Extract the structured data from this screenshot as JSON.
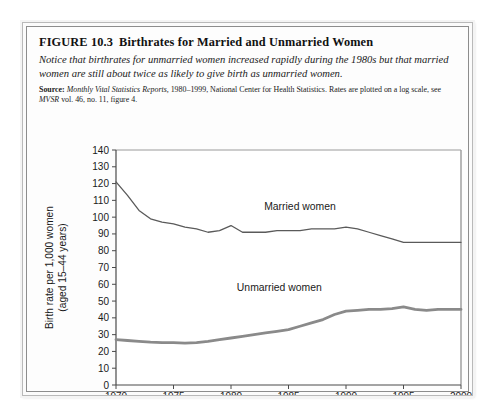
{
  "figure": {
    "number": "FIGURE 10.3",
    "title": "Birthrates for Married and Unmarried Women",
    "note": "Notice that birthrates for unmarried women increased rapidly during the 1980s but that married women are still about twice as likely to give birth as unmarried women.",
    "source_label": "Source:",
    "source_italic_1": "Monthly Vital Statistics Reports,",
    "source_rest_1": " 1980–1999, National Center for Health Statistics. Rates are plotted on a log scale, see ",
    "source_italic_2": "MVSR",
    "source_rest_2": " vol. 46, no. 11, figure 4."
  },
  "chart_data": {
    "type": "line",
    "title": "Birthrates for Married and Unmarried Women",
    "xlabel": "",
    "ylabel": "Birth rate per 1,000 women (aged 15–44 years)",
    "ylabel_line1": "Birth rate per 1,000 women",
    "ylabel_line2": "(aged 15–44 years)",
    "xlim": [
      1970,
      2000
    ],
    "ylim": [
      0,
      140
    ],
    "xticks": [
      1970,
      1975,
      1980,
      1985,
      1990,
      1995,
      2000
    ],
    "xtick_labels": [
      "1970",
      "1975",
      "1980",
      "1985",
      "1990",
      "1995",
      "2000"
    ],
    "yticks": [
      0,
      10,
      20,
      30,
      40,
      50,
      60,
      70,
      80,
      90,
      100,
      110,
      120,
      130,
      140
    ],
    "ytick_labels": [
      "0",
      "10",
      "20",
      "30",
      "40",
      "50",
      "60",
      "70",
      "80",
      "90",
      "100",
      "110",
      "120",
      "130",
      "140"
    ],
    "grid": false,
    "legend_position": "inline-annotations",
    "x": [
      1970,
      1971,
      1972,
      1973,
      1974,
      1975,
      1976,
      1977,
      1978,
      1979,
      1980,
      1981,
      1982,
      1983,
      1984,
      1985,
      1986,
      1987,
      1988,
      1989,
      1990,
      1991,
      1992,
      1993,
      1994,
      1995,
      1996,
      1997,
      1998,
      1999,
      2000
    ],
    "series": [
      {
        "name": "Married women",
        "color": "#5a5a5a",
        "width": 1.3,
        "label_x": 1986,
        "label_y": 104,
        "values": [
          121,
          113,
          104,
          99,
          97,
          96,
          94,
          93,
          91,
          92,
          95,
          91,
          91,
          91,
          92,
          92,
          92,
          93,
          93,
          93,
          94,
          93,
          91,
          89,
          87,
          85,
          85,
          85,
          85,
          85,
          85
        ]
      },
      {
        "name": "Unmarried women",
        "color": "#8a8a8a",
        "width": 2.8,
        "label_x": 1984.2,
        "label_y": 56,
        "values": [
          27,
          26.5,
          26,
          25.5,
          25.3,
          25.2,
          25,
          25.3,
          26,
          27,
          28,
          29,
          30,
          31,
          32,
          33,
          35,
          37,
          39,
          42,
          44,
          44.5,
          45,
          45,
          45.5,
          46.5,
          45,
          44.5,
          45,
          45,
          45
        ]
      }
    ]
  }
}
